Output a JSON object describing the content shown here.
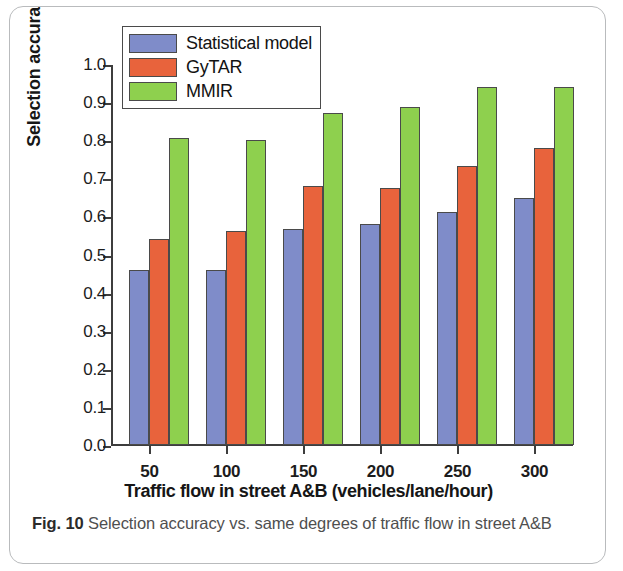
{
  "figure": {
    "caption_label": "Fig. 10",
    "caption_text": "Selection accuracy vs. same degrees of traffic flow in street A&B"
  },
  "legend": {
    "position": "top-left-inside",
    "entries": [
      {
        "label": "Statistical model",
        "color": "#7f8cc9"
      },
      {
        "label": "GyTAR",
        "color": "#e8633c"
      },
      {
        "label": "MMIR",
        "color": "#8ed04e"
      }
    ]
  },
  "chart_data": {
    "type": "bar",
    "title": "",
    "subtitle": "",
    "xlabel": "Traffic flow in street A&B (vehicles/lane/hour)",
    "ylabel": "Selection accuracy",
    "categories": [
      "50",
      "100",
      "150",
      "200",
      "250",
      "300"
    ],
    "series": [
      {
        "name": "Statistical model",
        "color": "#7f8cc9",
        "values": [
          0.46,
          0.46,
          0.567,
          0.581,
          0.611,
          0.648
        ]
      },
      {
        "name": "GyTAR",
        "color": "#e8633c",
        "values": [
          0.541,
          0.561,
          0.681,
          0.674,
          0.733,
          0.779
        ]
      },
      {
        "name": "MMIR",
        "color": "#8ed04e",
        "values": [
          0.806,
          0.8,
          0.872,
          0.887,
          0.94,
          0.939
        ]
      }
    ],
    "ylim": [
      0.0,
      1.0
    ],
    "ytick_labels": [
      "1.0",
      "0.9",
      "0.8",
      "0.7",
      "0.6",
      "0.5",
      "0.4",
      "0.3",
      "0.2",
      "0.1",
      "0.0"
    ],
    "ytick_values": [
      1.0,
      0.9,
      0.8,
      0.7,
      0.6,
      0.5,
      0.4,
      0.3,
      0.2,
      0.1,
      0.0
    ],
    "xtick_labels": [
      "50",
      "100",
      "150",
      "200",
      "250",
      "300"
    ],
    "grid": false,
    "legend_position": "upper left"
  }
}
